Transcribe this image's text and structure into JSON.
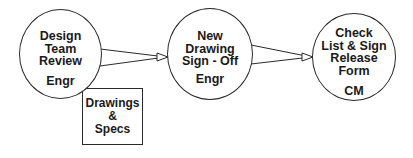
{
  "diagram": {
    "type": "process-flow",
    "nodes": [
      {
        "id": "design-team-review",
        "title_lines": [
          "Design",
          "Team",
          "Review"
        ],
        "role": "Engr"
      },
      {
        "id": "new-drawing-sign-off",
        "title_lines": [
          "New",
          "Drawing",
          "Sign - Off"
        ],
        "role": "Engr"
      },
      {
        "id": "check-list-sign-release-form",
        "title_lines": [
          "Check",
          "List & Sign",
          "Release",
          "Form"
        ],
        "role": "CM"
      }
    ],
    "document_box": {
      "lines": [
        "Drawings",
        "&",
        "Specs"
      ],
      "attached_to": "design-team-review"
    },
    "edges": [
      {
        "from": "design-team-review",
        "to": "new-drawing-sign-off"
      },
      {
        "from": "new-drawing-sign-off",
        "to": "check-list-sign-release-form"
      }
    ],
    "colors": {
      "stroke": "#2a2a2a",
      "background": "#ffffff",
      "text": "#1a1a1a"
    }
  }
}
